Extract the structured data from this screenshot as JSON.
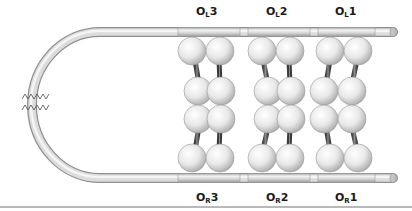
{
  "figure": {
    "top_labels": [
      {
        "id": "OL3",
        "base": "O",
        "sub": "L",
        "num": "3",
        "x": 196,
        "y": 5
      },
      {
        "id": "OL2",
        "base": "O",
        "sub": "L",
        "num": "2",
        "x": 266,
        "y": 5
      },
      {
        "id": "OL1",
        "base": "O",
        "sub": "L",
        "num": "1",
        "x": 335,
        "y": 5
      }
    ],
    "bottom_labels": [
      {
        "id": "OR3",
        "base": "O",
        "sub": "R",
        "num": "3",
        "x": 196,
        "y": 191
      },
      {
        "id": "OR2",
        "base": "O",
        "sub": "R",
        "num": "2",
        "x": 266,
        "y": 191
      },
      {
        "id": "OR1",
        "base": "O",
        "sub": "R",
        "num": "1",
        "x": 335,
        "y": 191
      }
    ],
    "colors": {
      "tube_light": "#f2f2f2",
      "tube_mid": "#d0d0d0",
      "tube_dark": "#9a9a9a",
      "sphere_light": "#ffffff",
      "sphere_dark": "#b5b5b5",
      "linker": "#555555",
      "zigzag": "#444444",
      "baseline": "#b8b8b8"
    }
  }
}
